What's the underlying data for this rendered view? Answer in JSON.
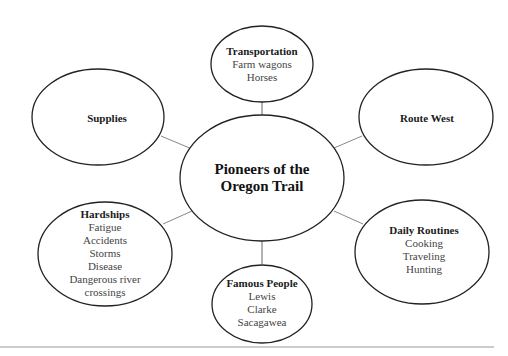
{
  "diagram": {
    "type": "concept-map",
    "center": {
      "title_line1": "Pioneers of the",
      "title_line2": "Oregon Trail"
    },
    "nodes": [
      {
        "id": "transportation",
        "title": "Transportation",
        "items": [
          "Farm wagons",
          "Horses"
        ]
      },
      {
        "id": "supplies",
        "title": "Supplies",
        "items": []
      },
      {
        "id": "route-west",
        "title": "Route West",
        "items": []
      },
      {
        "id": "hardships",
        "title": "Hardships",
        "items": [
          "Fatigue",
          "Accidents",
          "Storms",
          "Disease",
          "Dangerous river",
          "crossings"
        ]
      },
      {
        "id": "famous-people",
        "title": "Famous People",
        "items": [
          "Lewis",
          "Clarke",
          "Sacagawea"
        ]
      },
      {
        "id": "daily-routines",
        "title": "Daily Routines",
        "items": [
          "Cooking",
          "Traveling",
          "Hunting"
        ]
      }
    ],
    "colors": {
      "ellipse_stroke": "#222222",
      "connector": "#888888",
      "rule": "#999999"
    }
  }
}
